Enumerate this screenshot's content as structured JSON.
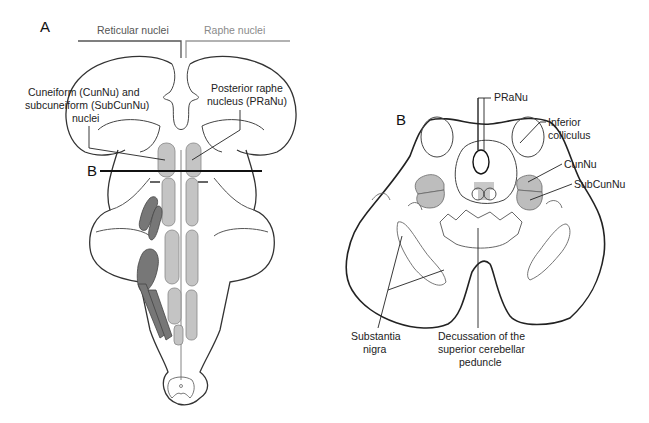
{
  "figure": {
    "panel_a": {
      "letter": "A",
      "group_labels": {
        "reticular": "Reticular nuclei",
        "raphe": "Raphe nuclei"
      },
      "callouts": {
        "cuneiform_line1": "Cuneiform (CunNu) and",
        "cuneiform_line2": "subcuneiform (SubCunNu)",
        "cuneiform_line3": "nuclei",
        "raphe_line1": "Posterior raphe",
        "raphe_line2": "nucleus (PRaNu)"
      },
      "section_marker": "B"
    },
    "panel_b": {
      "letter": "B",
      "callouts": {
        "praNu": "PRaNu",
        "inferior_line1": "Inferior",
        "inferior_line2": "colliculus",
        "cunNu": "CunNu",
        "subCunNu": "SubCunNu",
        "substantia_line1": "Substantia",
        "substantia_line2": "nigra",
        "decussation_line1": "Decussation of the",
        "decussation_line2": "superior cerebellar",
        "decussation_line3": "peduncle"
      }
    },
    "colors": {
      "outline": "#333333",
      "reticular_fill": "#777777",
      "raphe_fill": "#c4c4c4",
      "light_fill": "#bdbdbd",
      "raphe_label": "#8a8a8a",
      "reticular_label": "#555555"
    }
  }
}
